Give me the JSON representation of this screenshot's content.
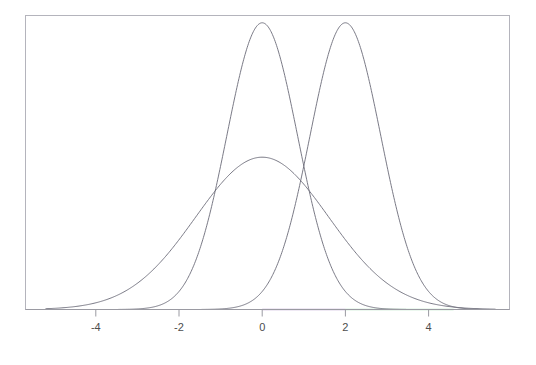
{
  "chart_data": {
    "type": "line",
    "title": "",
    "subtitle": "",
    "xlabel": "",
    "ylabel": "",
    "grid": false,
    "legend": null,
    "xlim": [
      -5.7,
      6.0
    ],
    "ylim": [
      0,
      0.52
    ],
    "xticks": [
      -4,
      -2,
      0,
      2,
      4
    ],
    "xtick_labels": [
      "-4",
      "-2",
      "0",
      "2",
      "4"
    ],
    "yticks": [],
    "ytick_labels": [],
    "series": [
      {
        "name": "wide-normal",
        "kind": "normal-pdf",
        "mean": 0,
        "sd": 1.6,
        "peak_value": 0.249,
        "color": "#6b6b78",
        "x_start": -5.2,
        "x_end": 5.6
      },
      {
        "name": "narrow-normal-centered",
        "kind": "normal-pdf",
        "mean": 0,
        "sd": 0.85,
        "peak_value": 0.469,
        "color": "#6b6b78",
        "x_start": -3.45,
        "x_end": 3.45
      },
      {
        "name": "narrow-normal-shifted",
        "kind": "normal-pdf",
        "mean": 2,
        "sd": 0.85,
        "peak_value": 0.469,
        "color": "#6b6b78",
        "x_start": -1.45,
        "x_end": 5.45
      }
    ],
    "axis_highlights": [
      {
        "name": "purple-segment",
        "from": 0,
        "to": 2,
        "color": "#9a79bd"
      },
      {
        "name": "green-segment",
        "from": 2,
        "to": 4.6,
        "color": "#86d39a"
      }
    ],
    "colors": {
      "curve": "#6b6b78",
      "frame": "#b4b4bc",
      "axis": "#9a9aa2",
      "tick_text": "#4d4d4d",
      "purple": "#9a79bd",
      "green": "#86d39a",
      "background": "#ffffff"
    }
  }
}
